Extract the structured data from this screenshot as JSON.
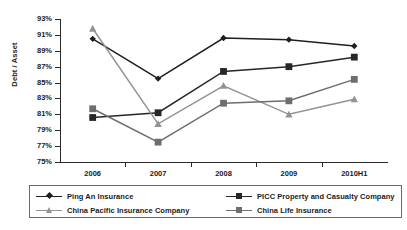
{
  "chart_data": {
    "type": "line",
    "title": "",
    "xlabel": "",
    "ylabel": "Debt / Asset",
    "categories": [
      "2006",
      "2007",
      "2008",
      "2009",
      "2010H1"
    ],
    "ylim": [
      75,
      93
    ],
    "ytick_labels": [
      "93%",
      "91%",
      "89%",
      "87%",
      "85%",
      "83%",
      "81%",
      "79%",
      "77%",
      "75%"
    ],
    "ytick_values": [
      93,
      91,
      89,
      87,
      85,
      83,
      81,
      79,
      77,
      75
    ],
    "grid": false,
    "legend_position": "bottom",
    "series": [
      {
        "name": "Ping An Insurance",
        "marker": "diamond",
        "color": "#1f1f1f",
        "values": [
          90.5,
          85.5,
          90.6,
          90.4,
          89.6
        ]
      },
      {
        "name": "PICC Property and Casualty Company",
        "marker": "square",
        "color": "#272727",
        "values": [
          80.6,
          81.2,
          86.4,
          87.0,
          88.2
        ]
      },
      {
        "name": "China Pacific Insurance Company",
        "marker": "triangle",
        "color": "#939393",
        "values": [
          91.8,
          79.8,
          84.6,
          81.0,
          82.9
        ]
      },
      {
        "name": "China Life Insurance",
        "marker": "square",
        "color": "#6e6e6e",
        "values": [
          81.7,
          77.5,
          82.4,
          82.7,
          85.4
        ]
      }
    ]
  },
  "legend": {
    "items": [
      {
        "label": "Ping An Insurance"
      },
      {
        "label": "PICC Property and Casualty Company"
      },
      {
        "label": "China Pacific Insurance Company"
      },
      {
        "label": "China Life Insurance"
      }
    ]
  }
}
